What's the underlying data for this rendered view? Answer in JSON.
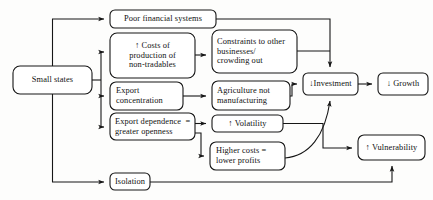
{
  "diagram": {
    "type": "flowchart",
    "canvas": {
      "width": 433,
      "height": 200
    },
    "colors": {
      "background": "#fdfdfc",
      "box_fill": "#ffffff",
      "stroke": "#161616",
      "text": "#111111"
    },
    "nodes": [
      {
        "id": "small-states",
        "label": "Small states",
        "lines": [
          "Small states"
        ],
        "x": 13,
        "y": 66,
        "w": 79,
        "h": 28,
        "font_size": 8.4,
        "align": "center"
      },
      {
        "id": "poor-financial-systems",
        "label": "Poor financial systems",
        "lines": [
          "Poor financial systems"
        ],
        "x": 110,
        "y": 10,
        "w": 106,
        "h": 18,
        "font_size": 8.4,
        "align": "center"
      },
      {
        "id": "costs-of-production",
        "label": "↑ Costs of production of non-tradables",
        "lines": [
          "↑ Costs of",
          "production of",
          "non-tradables"
        ],
        "x": 110,
        "y": 33,
        "w": 85,
        "h": 45,
        "font_size": 8.4,
        "align": "center"
      },
      {
        "id": "constraints-to-other-businesses",
        "label": "Constraints to other businesses/ crowding out",
        "lines": [
          "Constraints to other",
          "businesses/",
          "crowding out"
        ],
        "x": 212,
        "y": 30,
        "w": 85,
        "h": 43,
        "font_size": 8.4,
        "align": "left"
      },
      {
        "id": "export-concentration",
        "label": "Export concentration",
        "lines": [
          "Export",
          "concentration"
        ],
        "x": 110,
        "y": 82,
        "w": 73,
        "h": 28,
        "font_size": 8.4,
        "align": "left"
      },
      {
        "id": "agriculture-not-manufacturing",
        "label": "Agriculture not manufacturing",
        "lines": [
          "Agriculture not",
          "manufacturing"
        ],
        "x": 212,
        "y": 81,
        "w": 78,
        "h": 29,
        "font_size": 8.4,
        "align": "left"
      },
      {
        "id": "export-dependence",
        "label": "Export dependence = greater openness",
        "lines": [
          "Export dependence  =",
          "greater openness"
        ],
        "x": 110,
        "y": 113,
        "w": 85,
        "h": 27,
        "font_size": 8.4,
        "align": "left"
      },
      {
        "id": "volatility",
        "label": "↑ Volatility",
        "lines": [
          "↑ Volatility"
        ],
        "x": 212,
        "y": 115,
        "w": 71,
        "h": 17,
        "font_size": 8.4,
        "align": "center"
      },
      {
        "id": "higher-costs-lower-profits",
        "label": "Higher costs = lower profits",
        "lines": [
          "Higher costs =",
          "lower profits"
        ],
        "x": 210,
        "y": 142,
        "w": 75,
        "h": 28,
        "font_size": 8.4,
        "align": "left"
      },
      {
        "id": "investment",
        "label": "↓ Investment",
        "lines": [
          "↓Investment"
        ],
        "x": 303,
        "y": 73,
        "w": 55,
        "h": 22,
        "font_size": 8.4,
        "align": "center"
      },
      {
        "id": "growth",
        "label": "↓ Growth",
        "lines": [
          "↓ Growth"
        ],
        "x": 378,
        "y": 73,
        "w": 50,
        "h": 22,
        "font_size": 8.4,
        "align": "center"
      },
      {
        "id": "vulnerability",
        "label": "↑ Vulnerability",
        "lines": [
          "↑ Vulnerability"
        ],
        "x": 358,
        "y": 135,
        "w": 67,
        "h": 25,
        "font_size": 8.4,
        "align": "center"
      },
      {
        "id": "isolation",
        "label": "Isolation",
        "lines": [
          "Isolation"
        ],
        "x": 110,
        "y": 173,
        "w": 40,
        "h": 17,
        "font_size": 8.4,
        "align": "center"
      }
    ],
    "edges": [
      {
        "id": "small-states-to-poor-financial-systems",
        "from": "small-states",
        "to": "poor-financial-systems"
      },
      {
        "id": "small-states-to-costs-of-production",
        "from": "small-states",
        "to": "costs-of-production"
      },
      {
        "id": "small-states-to-export-concentration",
        "from": "small-states",
        "to": "export-concentration"
      },
      {
        "id": "small-states-to-export-dependence",
        "from": "small-states",
        "to": "export-dependence"
      },
      {
        "id": "small-states-to-isolation",
        "from": "small-states",
        "to": "isolation"
      },
      {
        "id": "costs-to-constraints",
        "from": "costs-of-production",
        "to": "constraints-to-other-businesses"
      },
      {
        "id": "export-concentration-to-agriculture",
        "from": "export-concentration",
        "to": "agriculture-not-manufacturing"
      },
      {
        "id": "export-dependence-to-volatility",
        "from": "export-dependence",
        "to": "volatility"
      },
      {
        "id": "export-dependence-to-higher-costs",
        "from": "export-dependence",
        "to": "higher-costs-lower-profits"
      },
      {
        "id": "poor-financial-systems-to-investment",
        "from": "poor-financial-systems",
        "to": "investment"
      },
      {
        "id": "constraints-to-investment",
        "from": "constraints-to-other-businesses",
        "to": "investment"
      },
      {
        "id": "agriculture-to-investment",
        "from": "agriculture-not-manufacturing",
        "to": "investment"
      },
      {
        "id": "volatility-to-investment",
        "from": "volatility",
        "to": "investment"
      },
      {
        "id": "higher-costs-to-investment",
        "from": "higher-costs-lower-profits",
        "to": "investment"
      },
      {
        "id": "volatility-to-vulnerability",
        "from": "volatility",
        "to": "vulnerability"
      },
      {
        "id": "investment-to-growth",
        "from": "investment",
        "to": "growth"
      },
      {
        "id": "isolation-to-vulnerability",
        "from": "isolation",
        "to": "vulnerability"
      }
    ]
  }
}
